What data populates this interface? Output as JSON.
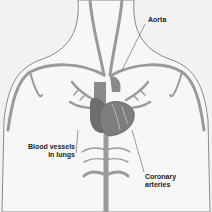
{
  "diagram": {
    "type": "anatomical-illustration",
    "labels": {
      "aorta": "Aorta",
      "blood_vessels_line1": "Blood vessels",
      "blood_vessels_line2": "in lungs",
      "coronary_line1": "Coronary",
      "coronary_line2": "arteries"
    },
    "colors": {
      "background": "#f2f2f2",
      "body_fill": "#f7f7f7",
      "body_outline": "#8a8a8a",
      "vessel": "#9a9a9a",
      "heart": "#7d7d7d",
      "heart_dark": "#5e5e5e",
      "label_text": "#222222"
    }
  }
}
